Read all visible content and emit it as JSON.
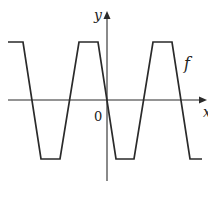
{
  "figure": {
    "type": "function-graph",
    "colors": {
      "stroke": "#2a2a2a",
      "background": "#ffffff"
    },
    "axes": {
      "x_label": "x",
      "y_label": "y",
      "origin_label": "0"
    },
    "curve_label": "f",
    "curve_points_px": [
      [
        8,
        42
      ],
      [
        23,
        42
      ],
      [
        41,
        159
      ],
      [
        60,
        159
      ],
      [
        79,
        42
      ],
      [
        98,
        42
      ],
      [
        116,
        159
      ],
      [
        134,
        159
      ],
      [
        153,
        42
      ],
      [
        172,
        42
      ],
      [
        190,
        159
      ],
      [
        202,
        159
      ]
    ]
  }
}
